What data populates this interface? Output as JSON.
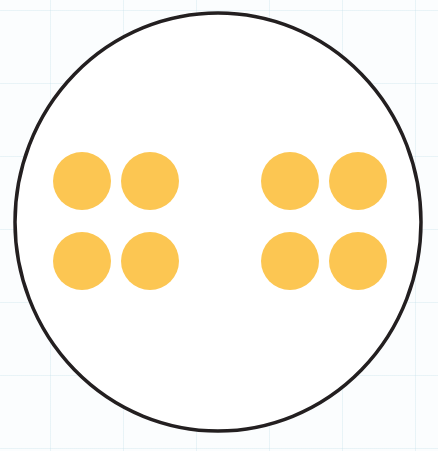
{
  "diagram": {
    "outer_shape": "circle",
    "outline_color": "#231f20",
    "fill_color": "#ffffff",
    "dot_color": "#fcc652",
    "groups": [
      {
        "name": "left-group",
        "count": 4,
        "rows": 2,
        "cols": 2
      },
      {
        "name": "right-group",
        "count": 4,
        "rows": 2,
        "cols": 2
      }
    ],
    "total_dots": 8
  }
}
